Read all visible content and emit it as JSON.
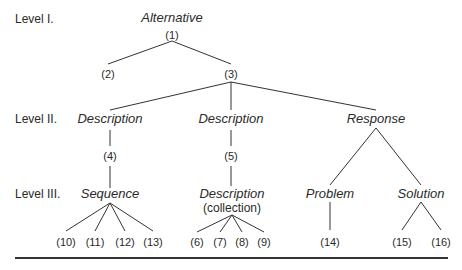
{
  "levels": [
    "Level I.",
    "Level II.",
    "Level III."
  ],
  "nodes": {
    "alternative": "Alternative",
    "n1": "(1)",
    "n2": "(2)",
    "n3": "(3)",
    "description_a": "Description",
    "description_b": "Description",
    "response": "Response",
    "n4": "(4)",
    "n5": "(5)",
    "sequence": "Sequence",
    "description_c": "Description",
    "collection": "(collection)",
    "problem": "Problem",
    "solution": "Solution",
    "n6": "(6)",
    "n7": "(7)",
    "n8": "(8)",
    "n9": "(9)",
    "n10": "(10)",
    "n11": "(11)",
    "n12": "(12)",
    "n13": "(13)",
    "n14": "(14)",
    "n15": "(15)",
    "n16": "(16)"
  }
}
